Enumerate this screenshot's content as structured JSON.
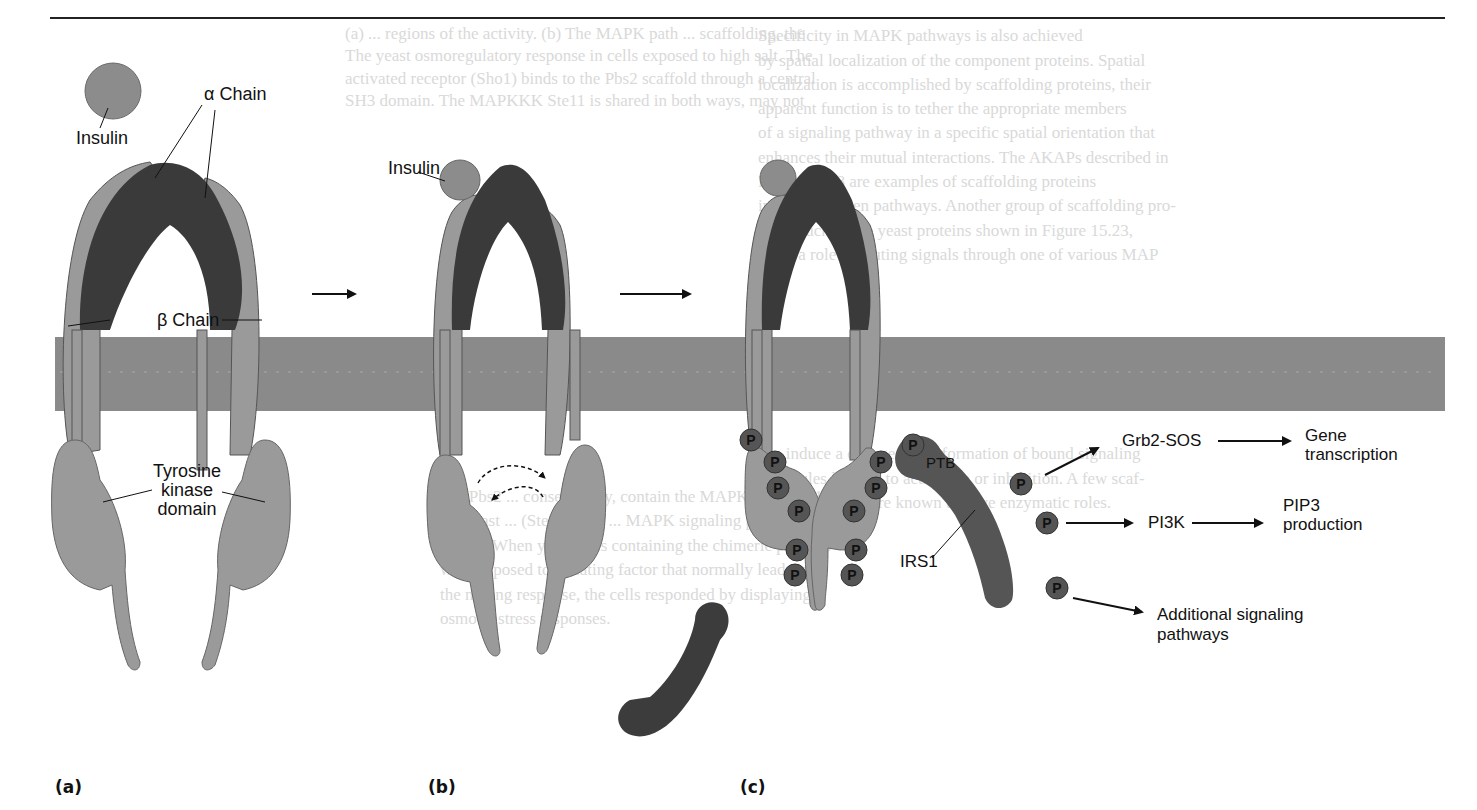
{
  "figure": {
    "panels": [
      {
        "id": "a",
        "label": "(a)"
      },
      {
        "id": "b",
        "label": "(b)"
      },
      {
        "id": "c",
        "label": "(c)"
      }
    ],
    "panel_a": {
      "insulin_label": "Insulin",
      "alpha_chain_label": "α Chain",
      "beta_chain_label": "β Chain",
      "kinase_label_line1": "Tyrosine",
      "kinase_label_line2": "kinase",
      "kinase_label_line3": "domain"
    },
    "panel_b": {
      "insulin_label": "Insulin"
    },
    "panel_c": {
      "phospho_glyph": "P",
      "ptb_label": "PTB",
      "irs1_label": "IRS1",
      "targets": [
        {
          "name": "Grb2-SOS",
          "downstream_line1": "Gene",
          "downstream_line2": "transcription"
        },
        {
          "name": "PI3K",
          "downstream_line1": "PIP3",
          "downstream_line2": "production"
        },
        {
          "name": "Additional signaling",
          "name_line2": "pathways"
        }
      ]
    },
    "colors": {
      "membrane": "#8a8a8a",
      "receptor_beta": "#9a9a9a",
      "receptor_alpha": "#3a3a3a",
      "insulin": "#8c8c8c",
      "irs1": "#555555",
      "phospho": "#555555",
      "bleed_text": "#d9d9d9"
    }
  },
  "bleed_through_text": [
    "(a) ... regions of the activity. (b) The MAPK path ... scaffolding, the",
    "The yeast osmoregulatory response in cells exposed to high salt. The",
    "activated receptor (Sho1) binds to the Pbs2 scaffold through a central",
    "SH3 domain. The MAPKKK Ste11 is shared in both ways, may not",
    "Specificity in MAPK pathways is also achieved",
    "by spatial localization of the component proteins. Spatial",
    "localization is accomplished by scaffolding proteins, their",
    "apparent function is to tether the appropriate members",
    "of a signaling pathway in a specific spatial orientation that",
    "enhances their mutual interactions. The AKAPs described in",
    "Figure 15.18 are examples of scaffolding proteins",
    "in cAMP-driven pathways. Another group of scaffolding pro-",
    "teins, such as the yeast proteins shown in Figure 15.23,",
    "plays a role in routing signals through one of various MAP",
    "can induce a change in conformation of bound signaling",
    "molecules leading to activation or inhibition. A few scaf-",
    "folding proteins are known to have enzymatic roles.",
    "and Pbs2 ... consequently, contain the MAPKK ... (Sho1 ...",
    "the yeast ... (Ste5, Pbs2) ... MAPK signaling pathways are",
    "15.23). When yeast cells containing the chimeric proteins",
    "were exposed to a mating factor that normally leads to",
    "the mating response, the cells responded by displaying",
    "osmotic stress responses."
  ]
}
